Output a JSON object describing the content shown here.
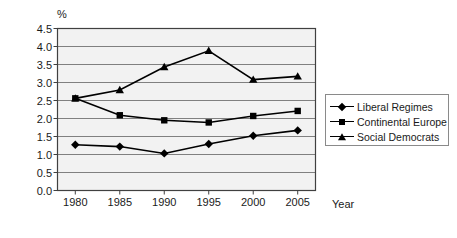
{
  "chart_data": {
    "type": "line",
    "title": "",
    "xlabel": "Year",
    "ylabel": "%",
    "x": [
      1980,
      1985,
      1990,
      1995,
      2000,
      2005
    ],
    "categories": [
      "1980",
      "1985",
      "1990",
      "1995",
      "2000",
      "2005"
    ],
    "xlim": [
      1978,
      2007
    ],
    "ylim": [
      0.0,
      4.5
    ],
    "yticks": [
      "0.0",
      "0.5",
      "1.0",
      "1.5",
      "2.0",
      "2.5",
      "3.0",
      "3.5",
      "4.0",
      "4.5"
    ],
    "grid": "horizontal",
    "legend_position": "right",
    "series": [
      {
        "name": "Liberal Regimes",
        "marker": "diamond",
        "values": [
          1.27,
          1.22,
          1.03,
          1.29,
          1.52,
          1.67
        ]
      },
      {
        "name": "Continental Europe",
        "marker": "square",
        "values": [
          2.56,
          2.09,
          1.95,
          1.89,
          2.07,
          2.21
        ]
      },
      {
        "name": "Social Democrats",
        "marker": "triangle",
        "values": [
          2.56,
          2.79,
          3.43,
          3.88,
          3.08,
          3.17
        ]
      }
    ],
    "colors": {
      "series_line": "#000000",
      "plot_background": "#f2f2f2",
      "gridline": "#808080",
      "axis": "#404040",
      "legend_border": "#8a8a8a"
    }
  },
  "axis": {
    "y_unit_label": "%",
    "x_title": "Year"
  }
}
